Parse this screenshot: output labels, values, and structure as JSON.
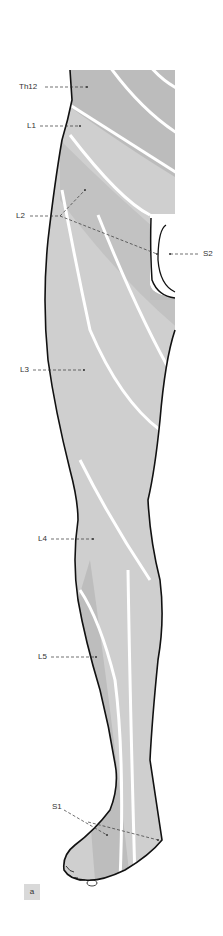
{
  "figure": {
    "label": "a",
    "colors": {
      "skin_dark": "#b9b9b9",
      "skin_mid": "#c8c8c8",
      "skin_light": "#dcdcdc",
      "boundary": "#ffffff",
      "outline": "#111111",
      "leader": "#333333"
    }
  },
  "labels": [
    {
      "id": "Th12",
      "text": "Th12",
      "x": 33,
      "y": 88
    },
    {
      "id": "L1",
      "text": "L1",
      "x": 27,
      "y": 127
    },
    {
      "id": "L2",
      "text": "L2",
      "x": 16,
      "y": 216
    },
    {
      "id": "S2",
      "text": "S2",
      "x": 203,
      "y": 254
    },
    {
      "id": "L3",
      "text": "L3",
      "x": 20,
      "y": 370
    },
    {
      "id": "L4",
      "text": "L4",
      "x": 38,
      "y": 539
    },
    {
      "id": "L5",
      "text": "L5",
      "x": 38,
      "y": 657
    },
    {
      "id": "S1",
      "text": "S1",
      "x": 52,
      "y": 806
    }
  ]
}
